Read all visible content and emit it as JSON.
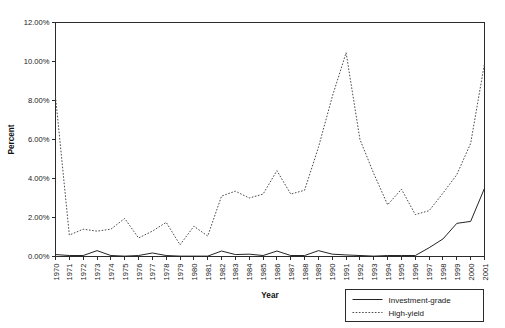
{
  "chart_data": {
    "type": "line",
    "title": "",
    "xlabel": "Year",
    "ylabel": "Percent",
    "ylim": [
      0,
      12
    ],
    "xlim": [
      1970,
      2001
    ],
    "grid": false,
    "legend_position": "bottom-right",
    "y_tick_labels": [
      "0.00%",
      "2.00%",
      "4.00%",
      "6.00%",
      "8.00%",
      "10.00%",
      "12.00%"
    ],
    "y_tick_values": [
      0,
      2,
      4,
      6,
      8,
      10,
      12
    ],
    "categories": [
      "1970",
      "1971",
      "1972",
      "1973",
      "1974",
      "1975",
      "1976",
      "1977",
      "1978",
      "1979",
      "1980",
      "1981",
      "1982",
      "1983",
      "1984",
      "1985",
      "1986",
      "1987",
      "1988",
      "1989",
      "1990",
      "1991",
      "1992",
      "1993",
      "1994",
      "1995",
      "1996",
      "1997",
      "1998",
      "1999",
      "2000",
      "2001"
    ],
    "series": [
      {
        "name": "Investment-grade",
        "style": "solid",
        "values": [
          0.1,
          0.05,
          0.05,
          0.3,
          0.05,
          0.02,
          0.05,
          0.18,
          0.05,
          0.02,
          0.02,
          0.02,
          0.28,
          0.1,
          0.12,
          0.05,
          0.28,
          0.05,
          0.05,
          0.3,
          0.12,
          0.08,
          0.05,
          0.02,
          0.05,
          0.05,
          0.05,
          0.45,
          0.9,
          1.7,
          1.8,
          3.5
        ]
      },
      {
        "name": "High-yield",
        "style": "dotted",
        "values": [
          8.2,
          1.1,
          1.4,
          1.3,
          1.4,
          1.95,
          0.95,
          1.3,
          1.75,
          0.6,
          1.55,
          1.05,
          3.1,
          3.35,
          3.0,
          3.2,
          4.4,
          3.2,
          3.4,
          5.6,
          8.2,
          10.45,
          6.0,
          4.25,
          2.65,
          3.45,
          2.15,
          2.35,
          3.25,
          4.2,
          5.8,
          9.9
        ]
      }
    ],
    "legend": [
      {
        "label": "Investment-grade",
        "style": "solid"
      },
      {
        "label": "High-yield",
        "style": "dotted"
      }
    ]
  }
}
